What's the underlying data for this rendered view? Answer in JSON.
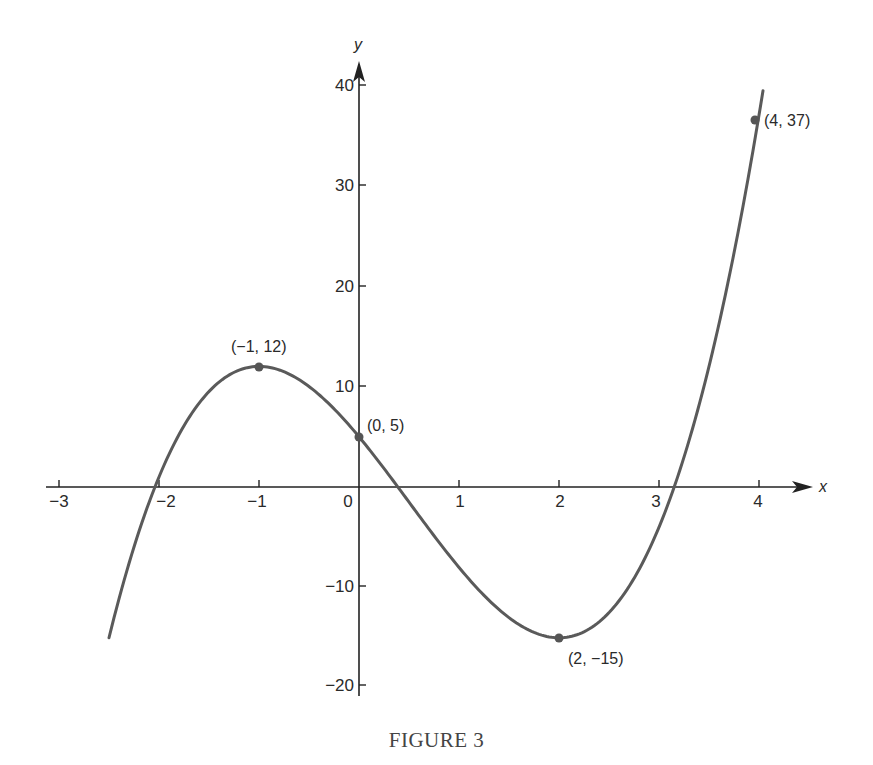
{
  "caption": "FIGURE 3",
  "colors": {
    "axis": "#222222",
    "curve": "#5a5a5a",
    "point": "#555555",
    "text": "#2a2a2a"
  },
  "chart_data": {
    "type": "line",
    "title": "FIGURE 3",
    "function": "y = 2x^3 - 3x^2 - 12x + 5",
    "xlabel": "x",
    "ylabel": "y",
    "xlim": [
      -3,
      4
    ],
    "ylim": [
      -20,
      40
    ],
    "grid": false,
    "legend": null,
    "x_ticks": [
      -3,
      -2,
      -1,
      0,
      1,
      2,
      3,
      4
    ],
    "y_ticks": [
      -20,
      -10,
      10,
      20,
      30,
      40
    ],
    "curve_domain": [
      -2.5,
      4.04
    ],
    "series": [
      {
        "name": "y = 2x^3 - 3x^2 - 12x + 5",
        "x": [
          -2.5,
          -2,
          -1.5,
          -1,
          -0.5,
          0,
          0.5,
          1,
          1.5,
          2,
          2.5,
          3,
          3.5,
          4
        ],
        "y": [
          -15,
          1,
          9.5,
          12,
          9.5,
          5,
          0,
          -8,
          -13,
          -15,
          -12.5,
          -4,
          10.75,
          37
        ]
      }
    ],
    "annotations": [
      {
        "x": -1,
        "y": 12,
        "text": "(−1, 12)"
      },
      {
        "x": 0,
        "y": 5,
        "text": "(0, 5)"
      },
      {
        "x": 2,
        "y": -15,
        "text": "(2, −15)"
      },
      {
        "x": 4,
        "y": 37,
        "text": "(4, 37)"
      }
    ]
  },
  "labels": {
    "x_ticks": [
      "−3",
      "−2",
      "−1",
      "0",
      "1",
      "2",
      "3",
      "4"
    ],
    "y_ticks": [
      "−20",
      "−10",
      "10",
      "20",
      "30",
      "40"
    ],
    "x_axis": "x",
    "y_axis": "y",
    "points": [
      "(−1, 12)",
      "(0, 5)",
      "(2, −15)",
      "(4, 37)"
    ]
  }
}
